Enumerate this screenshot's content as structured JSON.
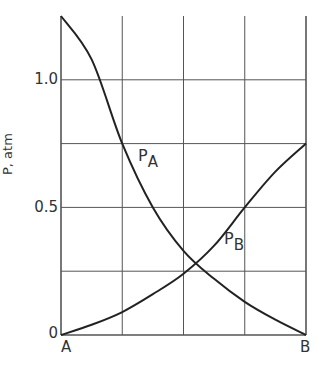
{
  "chart_data": {
    "type": "line",
    "title": "",
    "xlabel": "",
    "ylabel": "P, atm",
    "x_tick_labels": [
      "A",
      "B"
    ],
    "y_ticks": [
      0,
      0.5,
      1.0
    ],
    "y_tick_labels": [
      "0",
      "0.5",
      "1.0"
    ],
    "ylim": [
      0,
      1.25
    ],
    "xlim": [
      0,
      1
    ],
    "grid": true,
    "grid_x": [
      0,
      0.25,
      0.5,
      0.75,
      1.0
    ],
    "grid_y": [
      0,
      0.25,
      0.5,
      0.75,
      1.0
    ],
    "x": [
      0,
      0.125,
      0.25,
      0.375,
      0.5,
      0.625,
      0.75,
      0.875,
      1.0
    ],
    "series": [
      {
        "name": "P_A",
        "label": "P",
        "subscript": "A",
        "values": [
          1.25,
          1.08,
          0.75,
          0.5,
          0.33,
          0.22,
          0.13,
          0.06,
          0.0
        ]
      },
      {
        "name": "P_B",
        "label": "P",
        "subscript": "B",
        "values": [
          0.0,
          0.04,
          0.09,
          0.16,
          0.24,
          0.35,
          0.5,
          0.64,
          0.75
        ]
      }
    ]
  }
}
